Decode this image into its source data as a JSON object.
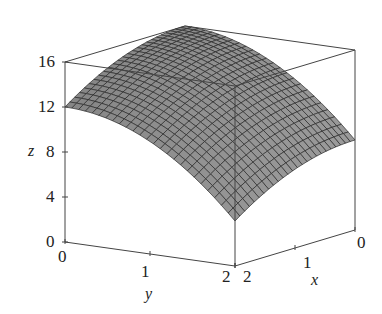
{
  "chart_data": {
    "type": "surface3d",
    "title": "",
    "function_approx": "z = 16 - x^2 - 2*y^2",
    "x": {
      "label": "x",
      "range": [
        0,
        2
      ],
      "ticks": [
        "0",
        "1",
        "2"
      ]
    },
    "y": {
      "label": "y",
      "range": [
        0,
        2
      ],
      "ticks": [
        "0",
        "1",
        "2"
      ]
    },
    "z": {
      "label": "z",
      "range": [
        0,
        16
      ],
      "ticks": [
        "0",
        "4",
        "8",
        "12",
        "16"
      ]
    },
    "corner_values": [
      {
        "x": 0,
        "y": 0,
        "z": 16
      },
      {
        "x": 2,
        "y": 0,
        "z": 12
      },
      {
        "x": 0,
        "y": 2,
        "z": 8
      },
      {
        "x": 2,
        "y": 2,
        "z": 4
      }
    ],
    "grid_resolution": 25,
    "box": true,
    "surface_color": "#8a8a8a",
    "mesh_color": "#2a2a2a"
  },
  "labels": {
    "z_ticks": [
      "16",
      "12",
      "8",
      "4",
      "0"
    ],
    "y_ticks": [
      "0",
      "1",
      "2"
    ],
    "x_ticks": [
      "2",
      "1",
      "0"
    ],
    "x_axis": "x",
    "y_axis": "y",
    "z_axis": "z"
  }
}
